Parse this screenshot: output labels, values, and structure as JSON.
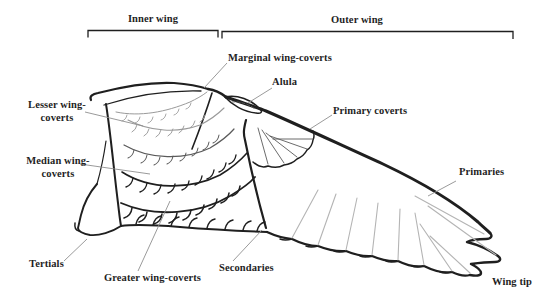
{
  "figure": {
    "colors": {
      "ink": "#1f1f1f",
      "shaft": "#b4b4b4",
      "leader": "#8f8f8f",
      "background": "#ffffff"
    }
  },
  "brackets": {
    "inner_wing": "Inner wing",
    "outer_wing": "Outer wing"
  },
  "labels": {
    "marginal_wing_coverts": "Marginal wing-coverts",
    "alula": "Alula",
    "primary_coverts": "Primary coverts",
    "lesser_wing_coverts": "Lesser wing-coverts",
    "median_wing_coverts": "Median wing-coverts",
    "primaries": "Primaries",
    "tertials": "Tertials",
    "greater_wing_coverts": "Greater wing-coverts",
    "secondaries": "Secondaries",
    "wing_tip": "Wing tip"
  }
}
